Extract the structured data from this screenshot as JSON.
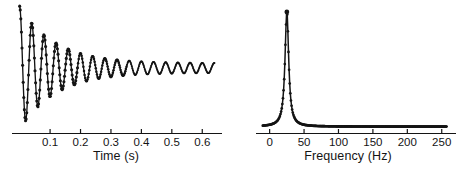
{
  "figure": {
    "name": "damped-oscillation-and-spectrum",
    "background": "#ffffff",
    "ink": "#141414",
    "width": 464,
    "height": 177
  },
  "chart_data": [
    {
      "id": "time-series",
      "type": "line",
      "title": "",
      "xlabel": "Time (s)",
      "ylabel": "",
      "xlim": [
        -0.012,
        0.655
      ],
      "ylim": [
        -1.15,
        1.15
      ],
      "grid": false,
      "legend": null,
      "markers": "filled-circle",
      "xticks": [
        0.1,
        0.2,
        0.3,
        0.4,
        0.5,
        0.6
      ],
      "xticklabels": [
        "0.1",
        "0.2",
        "0.3",
        "0.4",
        "0.5",
        "0.6"
      ],
      "yticks": [],
      "yticklabels": [],
      "axis": "bottom-only",
      "description": "Exponentially damped sinusoid, sampled, oscillating about zero and decaying to a small residual ripple.",
      "model": {
        "form": "y = A * exp(-t/tau) * cos(2*pi*f*t)",
        "A": 1.0,
        "tau": 0.115,
        "f": 25.0,
        "offset_floor": 0.085,
        "samples": 330,
        "t_start": 0.0,
        "t_end": 0.64
      }
    },
    {
      "id": "frequency-spectrum",
      "type": "line",
      "title": "",
      "xlabel": "Frequency (Hz)",
      "ylabel": "",
      "xlim": [
        -14,
        262
      ],
      "ylim": [
        0,
        1.06
      ],
      "grid": false,
      "legend": null,
      "markers": "filled-circle",
      "xticks": [
        0,
        50,
        100,
        150,
        200,
        250
      ],
      "xticklabels": [
        "0",
        "50",
        "100",
        "150",
        "200",
        "250"
      ],
      "yticks": [],
      "yticklabels": [],
      "axis": "bottom-only",
      "description": "Single sharp Lorentzian resonance peak centred near 25 Hz with a narrow width; flat near-zero baseline out to 250 Hz.",
      "peak": {
        "center_hz": 25.0,
        "height": 1.0,
        "halfwidth_hz": 3.2
      },
      "baseline": 0.012,
      "model": {
        "form": "y = h / (1 + ((f - f0)/w)^2)",
        "f0": 25.0,
        "h": 1.0,
        "w": 3.2,
        "samples": 300,
        "f_start": -10,
        "f_end": 257
      }
    }
  ]
}
